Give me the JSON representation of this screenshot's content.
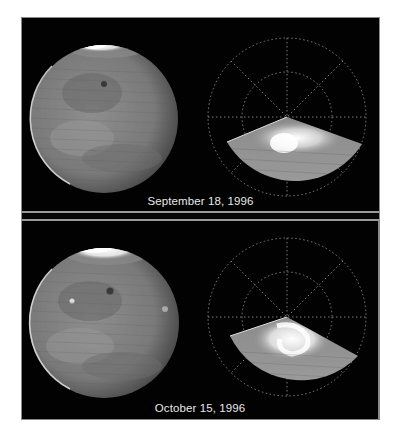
{
  "figure": {
    "panels": [
      {
        "id": "top",
        "caption": "September 18, 1996",
        "left_view": "full-disk-planet",
        "right_view": "polar-projection-north",
        "polar_cap": "small-bright-cap"
      },
      {
        "id": "bottom",
        "caption": "October 15, 1996",
        "left_view": "full-disk-planet",
        "right_view": "polar-projection-north",
        "polar_cap": "large-bright-swirl-cap"
      }
    ],
    "colors": {
      "background": "#020202",
      "frame": "#8a8a8a",
      "caption_text": "#e8e8e8",
      "planet_base": "#7a7a7a",
      "cap_bright": "#f2f2f2",
      "grid_dots": "#9a9a9a"
    }
  }
}
